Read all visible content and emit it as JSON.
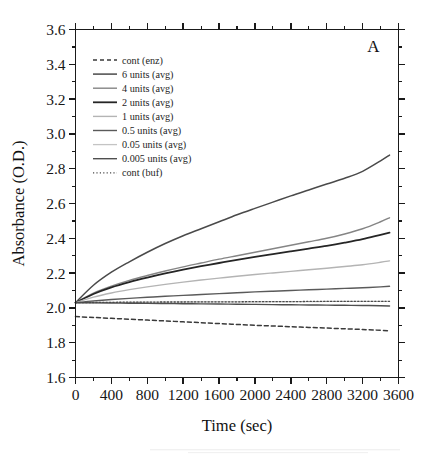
{
  "figure": {
    "panel_label": "A",
    "background_color": "#ffffff",
    "axis_color": "#1a1a1a"
  },
  "chart_data": {
    "type": "line",
    "title": "",
    "subtitle": "",
    "xlabel": "Time (sec)",
    "ylabel": "Absorbance (O.D.)",
    "xlim": [
      0,
      3600
    ],
    "ylim": [
      1.6,
      3.6
    ],
    "x_major_ticks": [
      0,
      400,
      800,
      1200,
      1600,
      2000,
      2400,
      2800,
      3200,
      3600
    ],
    "x_tick_labels": [
      "0",
      "400",
      "800",
      "1200",
      "1600",
      "2000",
      "2400",
      "2800",
      "3200",
      "3600"
    ],
    "x_minor_step": 200,
    "y_major_ticks": [
      1.6,
      1.8,
      2.0,
      2.2,
      2.4,
      2.6,
      2.8,
      3.0,
      3.2,
      3.4,
      3.6
    ],
    "y_tick_labels": [
      "1.6",
      "1.8",
      "2.0",
      "2.2",
      "2.4",
      "2.6",
      "2.8",
      "3.0",
      "3.2",
      "3.4",
      "3.6"
    ],
    "y_minor_step": 0.1,
    "grid": false,
    "legend_position": "upper-left-inside",
    "annotations": [
      {
        "text": "A",
        "position": "top-right-inside"
      }
    ],
    "x": [
      0,
      200,
      400,
      600,
      800,
      1000,
      1200,
      1400,
      1600,
      1800,
      2000,
      2200,
      2400,
      2600,
      2800,
      3000,
      3200,
      3400,
      3500
    ],
    "series": [
      {
        "name": "cont (enz)",
        "label": "cont (enz)",
        "color": "#3a3a3a",
        "width": 1.5,
        "dash": "4,3",
        "style": "dashed",
        "values": [
          1.95,
          1.945,
          1.94,
          1.935,
          1.93,
          1.925,
          1.92,
          1.915,
          1.91,
          1.905,
          1.9,
          1.896,
          1.892,
          1.888,
          1.884,
          1.88,
          1.876,
          1.871,
          1.868
        ]
      },
      {
        "name": "6 units (avg)",
        "label": "6 units (avg)",
        "color": "#4a4a4a",
        "width": 1.5,
        "dash": "none",
        "style": "solid",
        "values": [
          2.03,
          2.13,
          2.205,
          2.265,
          2.32,
          2.37,
          2.415,
          2.455,
          2.495,
          2.535,
          2.572,
          2.608,
          2.644,
          2.678,
          2.712,
          2.745,
          2.785,
          2.845,
          2.878
        ]
      },
      {
        "name": "4 units (avg)",
        "label": "4 units (avg)",
        "color": "#858585",
        "width": 1.4,
        "dash": "none",
        "style": "solid",
        "values": [
          2.03,
          2.085,
          2.125,
          2.158,
          2.186,
          2.212,
          2.236,
          2.258,
          2.28,
          2.3,
          2.32,
          2.34,
          2.36,
          2.38,
          2.4,
          2.425,
          2.455,
          2.495,
          2.518
        ]
      },
      {
        "name": "2 units (avg)",
        "label": "2 units (avg)",
        "color": "#252525",
        "width": 1.8,
        "dash": "none",
        "style": "solid",
        "values": [
          2.03,
          2.08,
          2.118,
          2.148,
          2.174,
          2.198,
          2.22,
          2.24,
          2.258,
          2.276,
          2.293,
          2.309,
          2.325,
          2.341,
          2.357,
          2.375,
          2.395,
          2.42,
          2.432
        ]
      },
      {
        "name": "1 units (avg)",
        "label": "1 units (avg)",
        "color": "#b4b4b4",
        "width": 1.4,
        "dash": "none",
        "style": "solid",
        "values": [
          2.03,
          2.062,
          2.086,
          2.105,
          2.121,
          2.135,
          2.148,
          2.16,
          2.171,
          2.182,
          2.192,
          2.201,
          2.21,
          2.219,
          2.228,
          2.238,
          2.248,
          2.262,
          2.27
        ]
      },
      {
        "name": "0.5 units (avg)",
        "label": "0.5 units (avg)",
        "color": "#5a5a5a",
        "width": 1.4,
        "dash": "none",
        "style": "solid",
        "values": [
          2.03,
          2.04,
          2.048,
          2.055,
          2.061,
          2.067,
          2.072,
          2.077,
          2.082,
          2.087,
          2.092,
          2.096,
          2.1,
          2.104,
          2.108,
          2.112,
          2.116,
          2.121,
          2.124
        ]
      },
      {
        "name": "0.05 units (avg)",
        "label": "0.05 units (avg)",
        "color": "#c4c4c4",
        "width": 1.3,
        "dash": "none",
        "style": "solid",
        "values": [
          2.03,
          2.031,
          2.032,
          2.032,
          2.033,
          2.033,
          2.034,
          2.034,
          2.035,
          2.035,
          2.035,
          2.036,
          2.036,
          2.036,
          2.037,
          2.037,
          2.037,
          2.038,
          2.038
        ]
      },
      {
        "name": "0.005 units (avg)",
        "label": "0.005 units (avg)",
        "color": "#4f4f4f",
        "width": 1.4,
        "dash": "none",
        "style": "solid",
        "values": [
          2.03,
          2.029,
          2.028,
          2.027,
          2.026,
          2.025,
          2.024,
          2.023,
          2.022,
          2.021,
          2.02,
          2.019,
          2.018,
          2.017,
          2.016,
          2.015,
          2.014,
          2.012,
          2.011
        ]
      },
      {
        "name": "cont (buf)",
        "label": "cont (buf)",
        "color": "#4a4a4a",
        "width": 1.3,
        "dash": "1.2,2.2",
        "style": "dotted",
        "values": [
          2.03,
          2.031,
          2.032,
          2.033,
          2.033,
          2.034,
          2.034,
          2.035,
          2.035,
          2.035,
          2.036,
          2.036,
          2.036,
          2.037,
          2.037,
          2.037,
          2.038,
          2.038,
          2.038
        ]
      }
    ]
  },
  "legend": {
    "entries": [
      {
        "label": "cont (enz)"
      },
      {
        "label": "6 units (avg)"
      },
      {
        "label": "4 units (avg)"
      },
      {
        "label": "2 units (avg)"
      },
      {
        "label": "1 units (avg)"
      },
      {
        "label": "0.5 units (avg)"
      },
      {
        "label": "0.05 units (avg)"
      },
      {
        "label": "0.005 units (avg)"
      },
      {
        "label": "cont (buf)"
      }
    ]
  }
}
